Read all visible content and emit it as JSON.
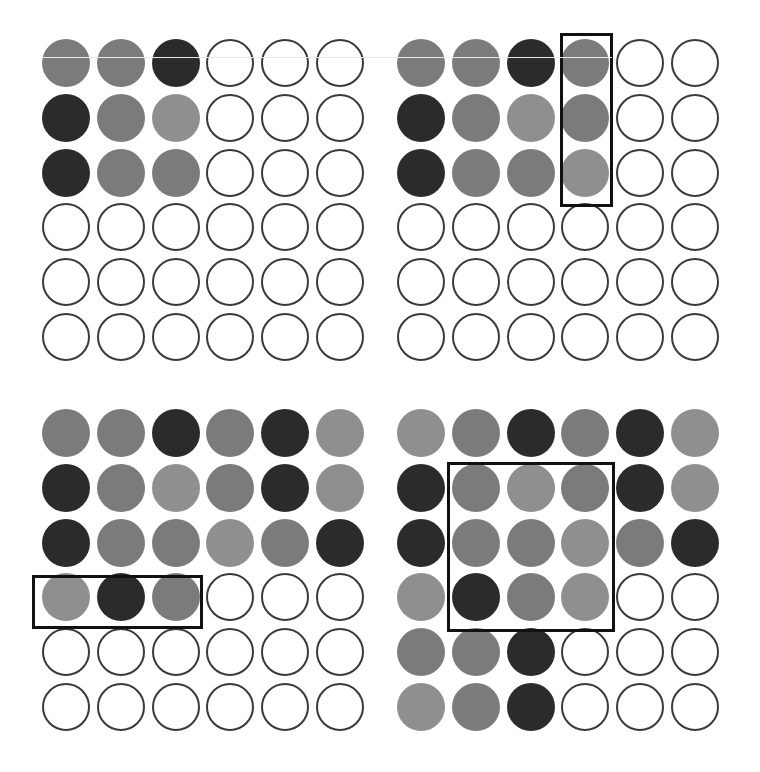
{
  "figure": {
    "legend_shades": {
      "D": "#2b2b2b",
      "M": "#7b7b7b",
      "L": "#8f8f8f",
      "E": "empty"
    },
    "panels": [
      {
        "id": "top-left",
        "origin": [
          42,
          39
        ],
        "rows": [
          [
            "M",
            "M",
            "D",
            "E",
            "E",
            "E"
          ],
          [
            "D",
            "M",
            "L",
            "E",
            "E",
            "E"
          ],
          [
            "D",
            "M",
            "M",
            "E",
            "E",
            "E"
          ],
          [
            "E",
            "E",
            "E",
            "E",
            "E",
            "E"
          ],
          [
            "E",
            "E",
            "E",
            "E",
            "E",
            "E"
          ],
          [
            "E",
            "E",
            "E",
            "E",
            "E",
            "E"
          ]
        ],
        "highlight": null
      },
      {
        "id": "top-right",
        "origin": [
          397,
          39
        ],
        "rows": [
          [
            "M",
            "M",
            "D",
            "M",
            "E",
            "E"
          ],
          [
            "D",
            "M",
            "L",
            "M",
            "E",
            "E"
          ],
          [
            "D",
            "M",
            "M",
            "L",
            "E",
            "E"
          ],
          [
            "E",
            "E",
            "E",
            "E",
            "E",
            "E"
          ],
          [
            "E",
            "E",
            "E",
            "E",
            "E",
            "E"
          ],
          [
            "E",
            "E",
            "E",
            "E",
            "E",
            "E"
          ]
        ],
        "highlight": {
          "x": 560,
          "y": 33,
          "w": 53,
          "h": 174
        }
      },
      {
        "id": "bottom-left",
        "origin": [
          42,
          409
        ],
        "rows": [
          [
            "M",
            "M",
            "D",
            "M",
            "D",
            "L"
          ],
          [
            "D",
            "M",
            "L",
            "M",
            "D",
            "L"
          ],
          [
            "D",
            "M",
            "M",
            "L",
            "M",
            "D"
          ],
          [
            "L",
            "D",
            "M",
            "E",
            "E",
            "E"
          ],
          [
            "E",
            "E",
            "E",
            "E",
            "E",
            "E"
          ],
          [
            "E",
            "E",
            "E",
            "E",
            "E",
            "E"
          ]
        ],
        "highlight": {
          "x": 32,
          "y": 575,
          "w": 171,
          "h": 54
        }
      },
      {
        "id": "bottom-right",
        "origin": [
          397,
          409
        ],
        "rows": [
          [
            "L",
            "M",
            "D",
            "M",
            "D",
            "L"
          ],
          [
            "D",
            "M",
            "L",
            "M",
            "D",
            "L"
          ],
          [
            "D",
            "M",
            "M",
            "L",
            "M",
            "D"
          ],
          [
            "L",
            "D",
            "M",
            "L",
            "E",
            "E"
          ],
          [
            "M",
            "M",
            "D",
            "E",
            "E",
            "E"
          ],
          [
            "L",
            "M",
            "D",
            "E",
            "E",
            "E"
          ]
        ],
        "highlight": {
          "x": 447,
          "y": 462,
          "w": 168,
          "h": 170
        }
      }
    ],
    "grid": {
      "rows": 6,
      "cols": 6,
      "pitch": 54.8,
      "diameter": 48
    }
  }
}
